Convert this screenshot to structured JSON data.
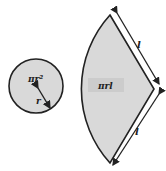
{
  "diagram": {
    "circle": {
      "label": "πr²",
      "radius_label": "r",
      "fill": "#d9d9d9",
      "stroke": "#222222"
    },
    "sector": {
      "label": "πrl",
      "fill": "#d9d9d9",
      "stroke": "#222222"
    },
    "slant_top_label": "l",
    "slant_bottom_label": "l"
  }
}
